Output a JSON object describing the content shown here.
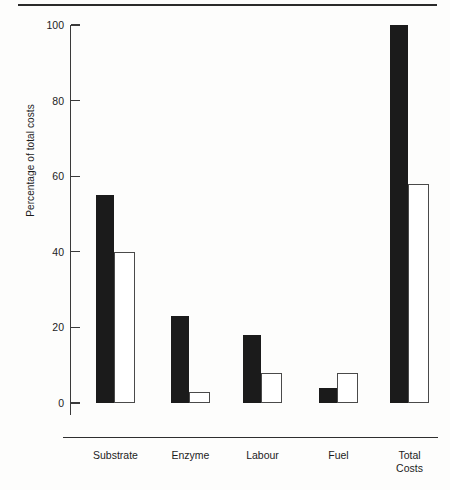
{
  "chart_data": {
    "type": "bar",
    "title": "",
    "xlabel": "",
    "ylabel": "Percentage of total costs",
    "ylim": [
      0,
      100
    ],
    "yticks": [
      0,
      20,
      40,
      60,
      80,
      100
    ],
    "ytick_labels": [
      "0",
      "20",
      "40",
      "60",
      "80",
      "100"
    ],
    "grid": false,
    "legend": null,
    "categories": [
      "Substrate",
      "Enzyme",
      "Labour",
      "Fuel",
      "Total\nCosts"
    ],
    "series": [
      {
        "name": "solid",
        "style": "filled-black",
        "color": "#1b1b1b",
        "values": [
          55,
          23,
          18,
          4,
          100
        ]
      },
      {
        "name": "open",
        "style": "outlined-white",
        "color": "#ffffff",
        "values": [
          40,
          3,
          8,
          8,
          58
        ]
      }
    ]
  },
  "axis": {
    "y_title": "Percentage of total costs"
  }
}
